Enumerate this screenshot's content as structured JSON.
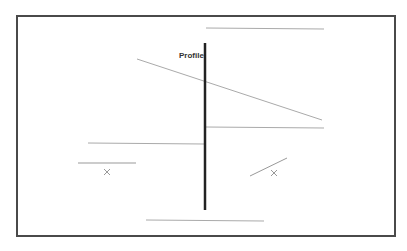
{
  "diagram": {
    "label": "Profile",
    "colors": {
      "frame": "#4a4a4a",
      "axis": "#222222",
      "lines": "#aaaaaa",
      "marks": "#999999"
    },
    "elements": [
      {
        "type": "line",
        "name": "top-line",
        "x1": 206,
        "y1": 28,
        "x2": 324,
        "y2": 29
      },
      {
        "type": "line",
        "name": "vertical-axis",
        "x1": 205,
        "y1": 43,
        "x2": 205,
        "y2": 210
      },
      {
        "type": "line",
        "name": "diagonal-line",
        "x1": 137,
        "y1": 59,
        "x2": 322,
        "y2": 120
      },
      {
        "type": "line",
        "name": "right-horizontal-line",
        "x1": 206,
        "y1": 127,
        "x2": 324,
        "y2": 128
      },
      {
        "type": "line",
        "name": "left-horizontal-line",
        "x1": 88,
        "y1": 143,
        "x2": 204,
        "y2": 144
      },
      {
        "type": "line",
        "name": "short-left-line",
        "x1": 78,
        "y1": 163,
        "x2": 136,
        "y2": 163
      },
      {
        "type": "cross",
        "name": "left-cross",
        "x": 107,
        "y": 172
      },
      {
        "type": "line",
        "name": "short-diagonal-line",
        "x1": 250,
        "y1": 176,
        "x2": 287,
        "y2": 158
      },
      {
        "type": "cross",
        "name": "right-cross",
        "x": 274,
        "y": 173
      },
      {
        "type": "line",
        "name": "bottom-line",
        "x1": 146,
        "y1": 220,
        "x2": 264,
        "y2": 221
      }
    ]
  }
}
